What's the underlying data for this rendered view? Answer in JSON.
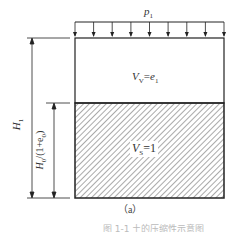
{
  "diagram": {
    "load_label": "p",
    "load_sub": "1",
    "load_arrow_count": 9,
    "void_label": "V",
    "void_sub": "V",
    "void_eq": "=e",
    "void_eq_sub": "1",
    "solid_label": "V",
    "solid_sub": "S",
    "solid_eq": "=1",
    "height_total_label": "H",
    "height_total_sub": "1",
    "height_solid_label": "H",
    "height_solid_sub": "0",
    "height_solid_rest": "/(1+e",
    "height_solid_rest_sub": "0",
    "height_solid_close": ")",
    "subfigure_label": "（a）",
    "caption_fragment": "图 1-1  土的压缩性示意图",
    "colors": {
      "line": "#222222",
      "hatch": "#555555",
      "background": "#ffffff"
    }
  }
}
